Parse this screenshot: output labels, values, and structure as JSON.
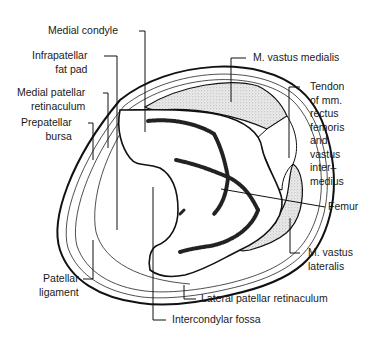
{
  "diagram": {
    "labels": {
      "medial_condyle": "Medial condyle",
      "infrapatellar_fat_pad": "Infrapatellar\nfat pad",
      "medial_patellar_retinaculum": "Medial patellar\nretinaculum",
      "prepatellar_bursa": "Prepatellar\nbursa",
      "patellar_ligament": "Patellar\nligament",
      "m_vastus_medialis": "M. vastus medialis",
      "tendon_rectus_vastus": "Tendon\nof mm.\nrectus\nfemoris\nand\nvastus\ninter–\nmedius",
      "femur": "Femur",
      "m_vastus_lateralis": "M. vastus\nlateralis",
      "lateral_patellar_retinaculum": "Lateral patellar retinaculum",
      "intercondylar_fossa": "Intercondylar fossa"
    },
    "colors": {
      "line": "#111111",
      "stipple": "#d8d8d8",
      "bone_texture": "#222222",
      "background": "#ffffff"
    }
  }
}
